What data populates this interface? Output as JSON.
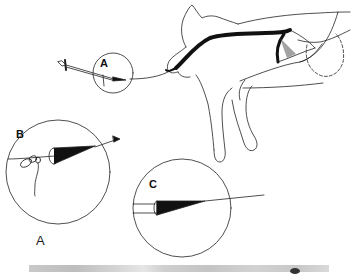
{
  "figure": {
    "callouts": [
      {
        "id": "A",
        "label": "A"
      },
      {
        "id": "B",
        "label": "B"
      },
      {
        "id": "C",
        "label": "C"
      }
    ],
    "panel_label": "A",
    "colors": {
      "line": "#222222",
      "fill_dark": "#111111",
      "background": "#ffffff"
    }
  }
}
